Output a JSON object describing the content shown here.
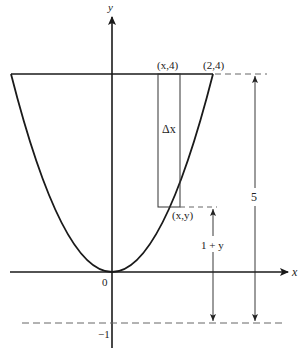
{
  "diagram": {
    "axes": {
      "x_label": "x",
      "y_label": "y",
      "origin_label": "0",
      "neg_one_label": "−1"
    },
    "points": {
      "top_strip": "(x,4)",
      "top_right": "(2,4)",
      "curve_point": "(x,y)"
    },
    "annotations": {
      "strip_width": "Δx",
      "total_distance": "5",
      "lower_distance": "1 + y"
    },
    "colors": {
      "stroke": "#1a1a1a",
      "thin_stroke": "#333333",
      "dash": "#666666"
    }
  }
}
